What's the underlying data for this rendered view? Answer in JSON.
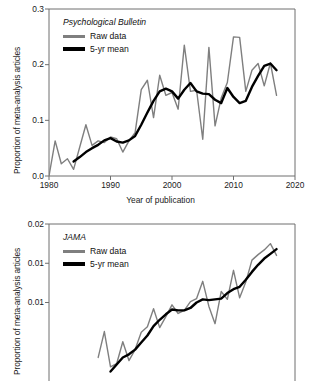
{
  "figure": {
    "panels": [
      "psychological-bulletin",
      "jama"
    ]
  },
  "chart_data": [
    {
      "type": "line",
      "title": "Psychological Bulletin",
      "xlabel": "Year of publication",
      "ylabel": "Proportion of meta-analysis articles",
      "xlim": [
        1980,
        2020
      ],
      "ylim": [
        0.0,
        0.3
      ],
      "xticks": [
        "1980",
        "1990",
        "2000",
        "2010",
        "2020"
      ],
      "yticks": [
        "0.0",
        "0.1",
        "0.2",
        "0.3"
      ],
      "grid": false,
      "legend_position": "top-left",
      "series": [
        {
          "name": "Raw data",
          "color": "#7f7f7f",
          "x": [
            1980,
            1981,
            1982,
            1983,
            1984,
            1985,
            1986,
            1987,
            1988,
            1989,
            1990,
            1991,
            1992,
            1993,
            1994,
            1995,
            1996,
            1997,
            1998,
            1999,
            2000,
            2001,
            2002,
            2003,
            2004,
            2005,
            2006,
            2007,
            2008,
            2009,
            2010,
            2011,
            2012,
            2013,
            2014,
            2015,
            2016,
            2017
          ],
          "values": [
            0.0,
            0.063,
            0.022,
            0.031,
            0.012,
            0.052,
            0.092,
            0.055,
            0.063,
            0.06,
            0.07,
            0.067,
            0.043,
            0.063,
            0.078,
            0.155,
            0.172,
            0.105,
            0.181,
            0.145,
            0.15,
            0.12,
            0.235,
            0.152,
            0.154,
            0.066,
            0.231,
            0.09,
            0.14,
            0.168,
            0.25,
            0.249,
            0.152,
            0.19,
            0.202,
            0.162,
            0.203,
            0.145
          ]
        },
        {
          "name": "5-yr mean",
          "color": "#000000",
          "x": [
            1984,
            1985,
            1986,
            1987,
            1988,
            1989,
            1990,
            1991,
            1992,
            1993,
            1994,
            1995,
            1996,
            1997,
            1998,
            1999,
            2000,
            2001,
            2002,
            2003,
            2004,
            2005,
            2006,
            2007,
            2008,
            2009,
            2010,
            2011,
            2012,
            2013,
            2014,
            2015,
            2016,
            2017
          ],
          "values": [
            0.026,
            0.034,
            0.043,
            0.05,
            0.056,
            0.064,
            0.068,
            0.062,
            0.06,
            0.064,
            0.072,
            0.092,
            0.114,
            0.135,
            0.152,
            0.157,
            0.152,
            0.139,
            0.155,
            0.167,
            0.152,
            0.148,
            0.147,
            0.137,
            0.131,
            0.158,
            0.142,
            0.131,
            0.135,
            0.16,
            0.18,
            0.198,
            0.202,
            0.19
          ]
        }
      ]
    },
    {
      "type": "line",
      "title": "JAMA",
      "xlabel": "Year of publication",
      "ylabel": "Proportion of meta-analysis articles",
      "xlim": [
        1980,
        2020
      ],
      "ylim": [
        0.0,
        0.02
      ],
      "yticks": [
        "0.02",
        "0.01",
        "0.01"
      ],
      "ytick_values": [
        0.02,
        0.015,
        0.01
      ],
      "grid": false,
      "legend_position": "top-left",
      "clipped_bottom": true,
      "series": [
        {
          "name": "Raw data",
          "color": "#7f7f7f",
          "x": [
            1988,
            1989,
            1990,
            1991,
            1992,
            1993,
            1994,
            1995,
            1996,
            1997,
            1998,
            1999,
            2000,
            2001,
            2002,
            2003,
            2004,
            2005,
            2006,
            2007,
            2008,
            2009,
            2010,
            2011,
            2012,
            2013,
            2014,
            2015,
            2016,
            2017
          ],
          "values": [
            0.003,
            0.0063,
            0.0018,
            0.0022,
            0.005,
            0.0026,
            0.004,
            0.0062,
            0.0069,
            0.0092,
            0.0068,
            0.0082,
            0.0097,
            0.0086,
            0.009,
            0.0101,
            0.0105,
            0.0127,
            0.0095,
            0.0073,
            0.0114,
            0.0104,
            0.0141,
            0.0106,
            0.0126,
            0.0154,
            0.0161,
            0.0167,
            0.0175,
            0.016
          ]
        },
        {
          "name": "5-yr mean",
          "color": "#000000",
          "x": [
            1990,
            1991,
            1992,
            1993,
            1994,
            1995,
            1996,
            1997,
            1998,
            1999,
            2000,
            2001,
            2002,
            2003,
            2004,
            2005,
            2006,
            2007,
            2008,
            2009,
            2010,
            2011,
            2012,
            2013,
            2014,
            2015,
            2016,
            2017
          ],
          "values": [
            0.0012,
            0.0021,
            0.003,
            0.0034,
            0.004,
            0.0049,
            0.0058,
            0.007,
            0.0078,
            0.0085,
            0.0091,
            0.009,
            0.009,
            0.0093,
            0.01,
            0.0104,
            0.0103,
            0.0104,
            0.0105,
            0.0112,
            0.0117,
            0.012,
            0.0129,
            0.0139,
            0.0148,
            0.0156,
            0.0162,
            0.0168
          ]
        }
      ]
    }
  ]
}
